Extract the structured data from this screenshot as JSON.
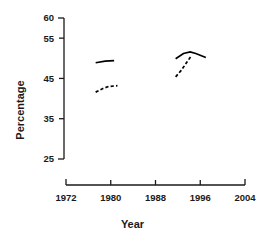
{
  "chart_data": {
    "type": "line",
    "title": "",
    "xlabel": "Year",
    "ylabel": "Percentage",
    "xlim": [
      1972,
      2004
    ],
    "ylim": [
      25,
      60
    ],
    "xticks": [
      1972,
      1980,
      1988,
      1996,
      2004
    ],
    "yticks": [
      25,
      35,
      45,
      55,
      60
    ],
    "xtick_labels": [
      "1972",
      "1980",
      "1988",
      "1996",
      "2004"
    ],
    "ytick_labels": [
      "25",
      "35",
      "45",
      "55",
      "60"
    ],
    "grid": false,
    "legend": "none",
    "axis_style": "bracket-range-axes",
    "series": [
      {
        "name": "upper-left-solid",
        "style": "solid",
        "points": [
          {
            "x": 1977.3,
            "y": 48.9
          },
          {
            "x": 1979.0,
            "y": 49.3
          },
          {
            "x": 1980.6,
            "y": 49.4
          }
        ]
      },
      {
        "name": "lower-left-dashed",
        "style": "dashed",
        "points": [
          {
            "x": 1977.3,
            "y": 41.6
          },
          {
            "x": 1978.6,
            "y": 42.5
          },
          {
            "x": 1979.6,
            "y": 43.0
          },
          {
            "x": 1981.2,
            "y": 43.2
          }
        ]
      },
      {
        "name": "right-solid",
        "style": "solid",
        "points": [
          {
            "x": 1991.6,
            "y": 49.9
          },
          {
            "x": 1993.0,
            "y": 51.2
          },
          {
            "x": 1994.2,
            "y": 51.6
          },
          {
            "x": 1995.2,
            "y": 51.2
          },
          {
            "x": 1997.0,
            "y": 50.2
          }
        ]
      },
      {
        "name": "right-dashed",
        "style": "dashed",
        "points": [
          {
            "x": 1991.6,
            "y": 45.4
          },
          {
            "x": 1992.6,
            "y": 47.0
          },
          {
            "x": 1993.6,
            "y": 49.0
          },
          {
            "x": 1994.4,
            "y": 50.6
          }
        ]
      }
    ]
  },
  "colors": {
    "line": "#000000",
    "axis": "#1a1a1a",
    "background": "#ffffff"
  },
  "geometry": {
    "y_axis_x": 64,
    "y_axis_top": 18,
    "y_axis_bottom": 159,
    "y_cap_len": 6,
    "y_tick_len": 5,
    "x_axis_y": 185,
    "x_axis_left": 66,
    "x_axis_right": 245,
    "x_cap_len": 6,
    "x_tick_len": 5,
    "plot_x_left": 66,
    "plot_x_right": 245,
    "plot_y_top": 18,
    "plot_y_bottom": 159
  }
}
